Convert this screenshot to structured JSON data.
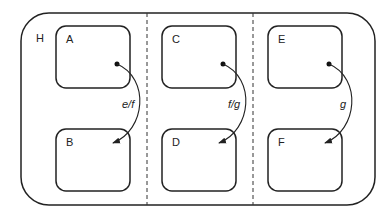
{
  "diagram": {
    "container": {
      "label": "H"
    },
    "states": [
      {
        "id": "A",
        "label": "A"
      },
      {
        "id": "B",
        "label": "B"
      },
      {
        "id": "C",
        "label": "C"
      },
      {
        "id": "D",
        "label": "D"
      },
      {
        "id": "E",
        "label": "E"
      },
      {
        "id": "F",
        "label": "F"
      }
    ],
    "transitions": [
      {
        "from": "A",
        "to": "B",
        "label": "e/f"
      },
      {
        "from": "C",
        "to": "D",
        "label": "f/g"
      },
      {
        "from": "E",
        "to": "F",
        "label": "g"
      }
    ],
    "regions": 3,
    "colors": {
      "stroke": "#222222",
      "background": "#ffffff"
    }
  }
}
